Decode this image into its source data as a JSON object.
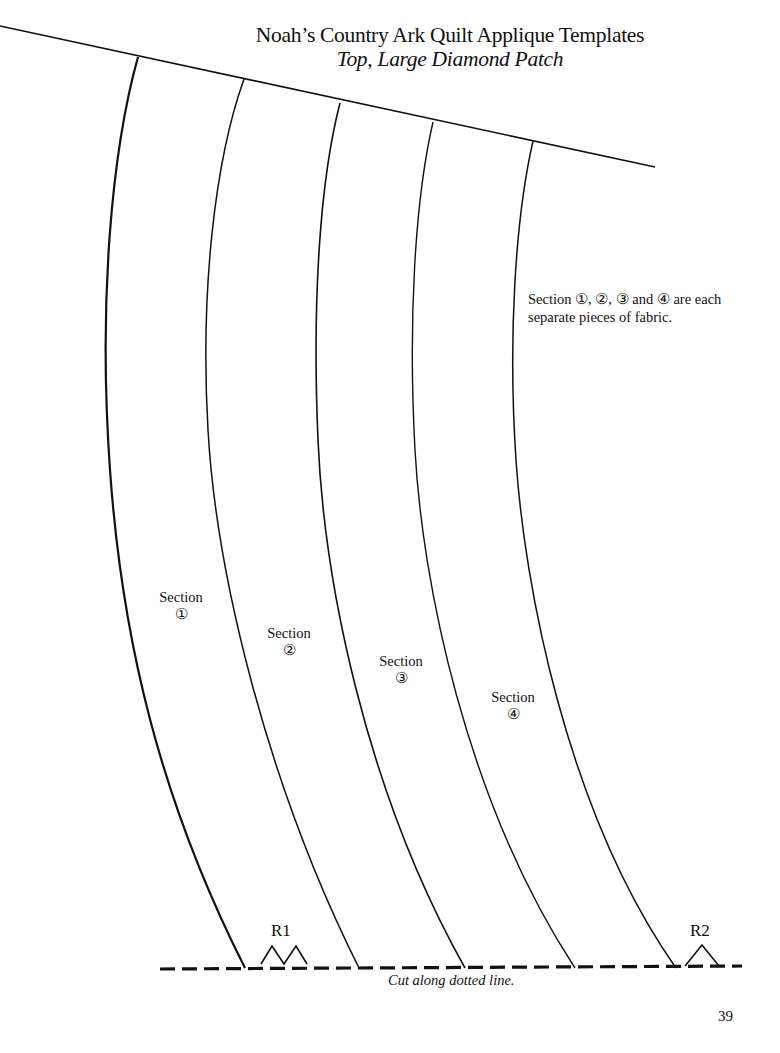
{
  "header": {
    "title": "Noah’s Country Ark Quilt Applique Templates",
    "subtitle": "Top, Large Diamond Patch"
  },
  "note": {
    "line1": "Section ①, ②, ③ and ④ are each",
    "line2": "separate pieces of fabric."
  },
  "sections": [
    {
      "label": "Section",
      "number": "①"
    },
    {
      "label": "Section",
      "number": "②"
    },
    {
      "label": "Section",
      "number": "③"
    },
    {
      "label": "Section",
      "number": "④"
    }
  ],
  "registration_marks": {
    "r1": "R1",
    "r2": "R2"
  },
  "cut_instruction": "Cut along dotted line.",
  "page_number": "39",
  "colors": {
    "ink": "#111111",
    "paper": "#ffffff"
  }
}
